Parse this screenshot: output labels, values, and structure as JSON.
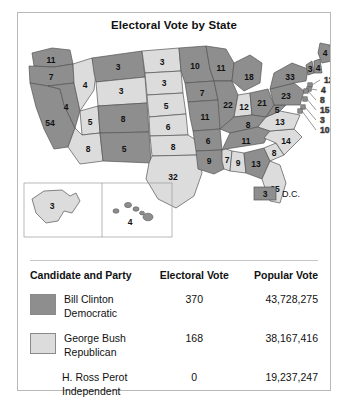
{
  "title": "Electoral Vote by State",
  "colors": {
    "democratic": "#8e8e8e",
    "republican": "#dcdcdc",
    "stroke": "#555555",
    "frame": "#b9b9b9",
    "text": "#111111"
  },
  "map": {
    "dc_legend": {
      "value": "3",
      "label": "D.C."
    },
    "states": [
      {
        "code": "WA",
        "value": "11",
        "party": "democratic"
      },
      {
        "code": "OR",
        "value": "7",
        "party": "democratic"
      },
      {
        "code": "CA",
        "value": "54",
        "party": "democratic"
      },
      {
        "code": "NV",
        "value": "4",
        "party": "democratic"
      },
      {
        "code": "ID",
        "value": "4",
        "party": "republican"
      },
      {
        "code": "MT",
        "value": "3",
        "party": "democratic"
      },
      {
        "code": "WY",
        "value": "3",
        "party": "republican"
      },
      {
        "code": "UT",
        "value": "5",
        "party": "republican"
      },
      {
        "code": "AZ",
        "value": "8",
        "party": "republican"
      },
      {
        "code": "CO",
        "value": "8",
        "party": "democratic"
      },
      {
        "code": "NM",
        "value": "5",
        "party": "democratic"
      },
      {
        "code": "ND",
        "value": "3",
        "party": "republican"
      },
      {
        "code": "SD",
        "value": "3",
        "party": "republican"
      },
      {
        "code": "NE",
        "value": "5",
        "party": "republican"
      },
      {
        "code": "KS",
        "value": "6",
        "party": "republican"
      },
      {
        "code": "OK",
        "value": "8",
        "party": "republican"
      },
      {
        "code": "TX",
        "value": "32",
        "party": "republican"
      },
      {
        "code": "MN",
        "value": "10",
        "party": "democratic"
      },
      {
        "code": "IA",
        "value": "7",
        "party": "democratic"
      },
      {
        "code": "MO",
        "value": "11",
        "party": "democratic"
      },
      {
        "code": "AR",
        "value": "6",
        "party": "democratic"
      },
      {
        "code": "LA",
        "value": "9",
        "party": "democratic"
      },
      {
        "code": "WI",
        "value": "11",
        "party": "democratic"
      },
      {
        "code": "IL",
        "value": "22",
        "party": "democratic"
      },
      {
        "code": "MI",
        "value": "18",
        "party": "democratic"
      },
      {
        "code": "IN",
        "value": "12",
        "party": "republican"
      },
      {
        "code": "OH",
        "value": "21",
        "party": "democratic"
      },
      {
        "code": "KY",
        "value": "8",
        "party": "democratic"
      },
      {
        "code": "TN",
        "value": "11",
        "party": "democratic"
      },
      {
        "code": "MS",
        "value": "7",
        "party": "republican"
      },
      {
        "code": "AL",
        "value": "9",
        "party": "republican"
      },
      {
        "code": "GA",
        "value": "13",
        "party": "democratic"
      },
      {
        "code": "FL",
        "value": "25",
        "party": "republican"
      },
      {
        "code": "SC",
        "value": "8",
        "party": "republican"
      },
      {
        "code": "NC",
        "value": "14",
        "party": "republican"
      },
      {
        "code": "VA",
        "value": "13",
        "party": "republican"
      },
      {
        "code": "WV",
        "value": "5",
        "party": "democratic"
      },
      {
        "code": "PA",
        "value": "23",
        "party": "democratic"
      },
      {
        "code": "NY",
        "value": "33",
        "party": "democratic"
      },
      {
        "code": "VT",
        "value": "3",
        "party": "democratic"
      },
      {
        "code": "NH",
        "value": "4",
        "party": "democratic"
      },
      {
        "code": "ME",
        "value": "4",
        "party": "democratic"
      },
      {
        "code": "MA",
        "value": "12",
        "party": "democratic"
      },
      {
        "code": "RI",
        "value": "4",
        "party": "democratic"
      },
      {
        "code": "CT",
        "value": "8",
        "party": "democratic"
      },
      {
        "code": "NJ",
        "value": "15",
        "party": "democratic"
      },
      {
        "code": "DE",
        "value": "3",
        "party": "democratic"
      },
      {
        "code": "MD",
        "value": "10",
        "party": "democratic"
      },
      {
        "code": "AK",
        "value": "3",
        "party": "republican"
      },
      {
        "code": "HI",
        "value": "4",
        "party": "democratic"
      }
    ]
  },
  "table": {
    "headers": {
      "candidate": "Candidate and Party",
      "electoral": "Electoral Vote",
      "popular": "Popular Vote"
    },
    "rows": [
      {
        "name": "Bill Clinton",
        "party": "Democratic",
        "swatch": "democratic",
        "electoral": "370",
        "popular": "43,728,275"
      },
      {
        "name": "George Bush",
        "party": "Republican",
        "swatch": "republican",
        "electoral": "168",
        "popular": "38,167,416"
      },
      {
        "name": "H. Ross Perot",
        "party": "Independent",
        "swatch": "none",
        "electoral": "0",
        "popular": "19,237,247"
      }
    ]
  }
}
